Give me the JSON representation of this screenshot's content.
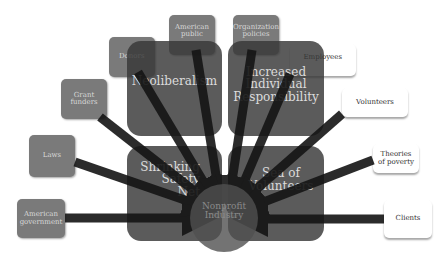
{
  "diagram": {
    "hub": {
      "label": "Nonprofit Industry"
    },
    "themes": [
      {
        "id": "neoliberalism",
        "label": "Neoliberalism"
      },
      {
        "id": "individual-responsibility",
        "label": "Increased Individual Responsibility"
      },
      {
        "id": "safety-net",
        "label": "Shrinking Safety Net"
      },
      {
        "id": "volunteers-sea",
        "label": "Sea of Volunteers"
      }
    ],
    "sources_left": [
      {
        "label": "American government"
      },
      {
        "label": "Laws"
      },
      {
        "label": "Grant funders"
      },
      {
        "label": "Donors"
      },
      {
        "label": "American public"
      },
      {
        "label": "Organization policies"
      }
    ],
    "sources_right": [
      {
        "label": "Employees"
      },
      {
        "label": "Volunteers"
      },
      {
        "label": "Theories of poverty"
      },
      {
        "label": "Clients"
      }
    ],
    "colors": {
      "theme_box": "#383838",
      "source_box": "#7a7a7a",
      "arrow": "#1a1a1a",
      "white_box": "#ffffff"
    }
  }
}
